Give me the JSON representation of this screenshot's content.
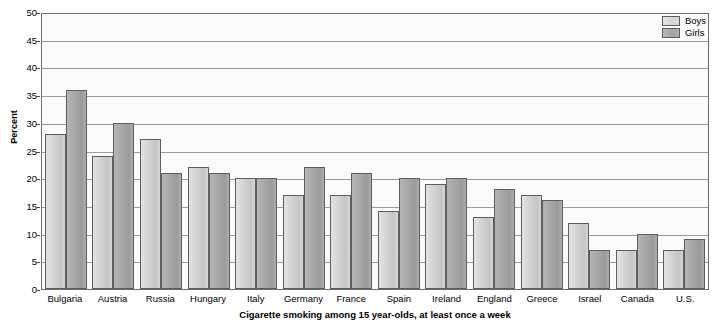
{
  "chart_data": {
    "type": "bar",
    "title": "Cigarette smoking among 15 year-olds, at least once a week",
    "xlabel": "",
    "ylabel": "Percent",
    "ylim": [
      0,
      50
    ],
    "ytick_step": 5,
    "yticks": [
      "50",
      "45",
      "40",
      "35",
      "30",
      "25",
      "20",
      "15",
      "10",
      "5",
      "0"
    ],
    "grid": true,
    "legend_position": "top-right",
    "categories": [
      "Bulgaria",
      "Austria",
      "Russia",
      "Hungary",
      "Italy",
      "Germany",
      "France",
      "Spain",
      "Ireland",
      "England",
      "Greece",
      "Israel",
      "Canada",
      "U.S."
    ],
    "series": [
      {
        "name": "Boys",
        "color": "#d4d4d4",
        "values": [
          28,
          24,
          27,
          22,
          20,
          17,
          17,
          14,
          19,
          13,
          17,
          12,
          7,
          7
        ]
      },
      {
        "name": "Girls",
        "color": "#a6a6a6",
        "values": [
          36,
          30,
          21,
          21,
          20,
          22,
          21,
          20,
          20,
          18,
          16,
          7,
          10,
          9
        ]
      }
    ]
  },
  "colors": {
    "boys": "#d4d4d4",
    "girls": "#a6a6a6",
    "axis": "#6d6d6d",
    "gridline": "#9a9a9a",
    "plot_background": "#fbfbfb"
  }
}
